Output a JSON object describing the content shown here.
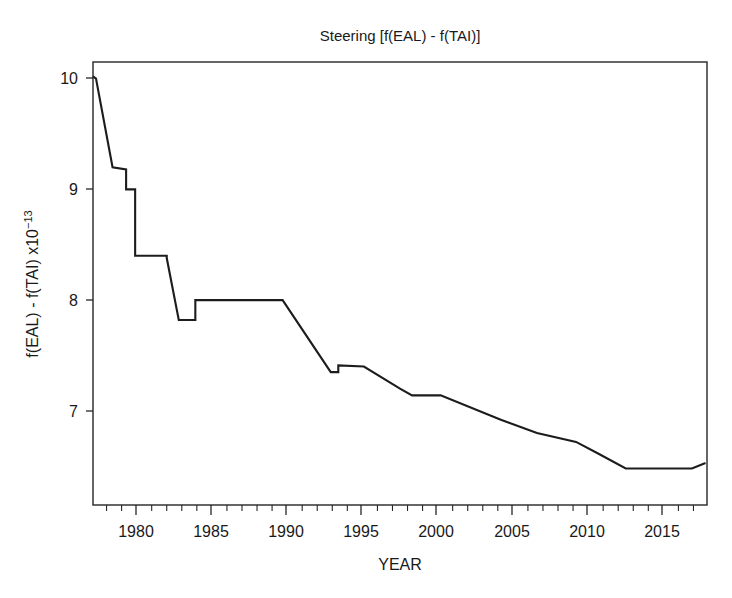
{
  "figure": {
    "background_color": "#ffffff",
    "line_color": "#1c1c1c",
    "axis_color": "#262626"
  },
  "chart_data": {
    "type": "line",
    "title": "Steering [f(EAL) - f(TAI)]",
    "xlabel": "YEAR",
    "ylabel": "f(EAL) - f(TAI) x10",
    "ylabel_exponent": "−13",
    "xlim": [
      1977.1,
      2017.9
    ],
    "ylim": [
      6.15,
      10.15
    ],
    "xticks": [
      1980,
      1985,
      1990,
      1995,
      2000,
      2005,
      2010,
      2015
    ],
    "xtick_labels": [
      "1980",
      "1985",
      "1990",
      "1995",
      "2000",
      "2005",
      "2010",
      "2015"
    ],
    "yticks": [
      7,
      8,
      9,
      10
    ],
    "ytick_labels": [
      "7",
      "8",
      "9",
      "10"
    ],
    "minor_xtick_step": 1,
    "grid": false,
    "legend": null,
    "series": [
      {
        "name": "f(EAL) - f(TAI)",
        "x": [
          1977.1,
          1977.3,
          1978.4,
          1978.4,
          1979.3,
          1979.3,
          1979.9,
          1979.9,
          1982.0,
          1982.0,
          1982.8,
          1982.8,
          1983.9,
          1983.9,
          1989.7,
          1992.9,
          1992.9,
          1993.4,
          1993.4,
          1995.1,
          1997.5,
          1998.3,
          2000.2,
          2004.2,
          2006.6,
          2009.2,
          2010.6,
          2012.5,
          2016.9,
          2017.8
        ],
        "y": [
          10.02,
          10.0,
          9.2,
          9.2,
          9.18,
          9.0,
          9.0,
          8.4,
          8.4,
          8.38,
          7.82,
          7.82,
          7.82,
          8.0,
          8.0,
          7.35,
          7.35,
          7.35,
          7.41,
          7.4,
          7.2,
          7.14,
          7.14,
          6.92,
          6.8,
          6.72,
          6.62,
          6.48,
          6.48,
          6.53
        ]
      }
    ]
  }
}
